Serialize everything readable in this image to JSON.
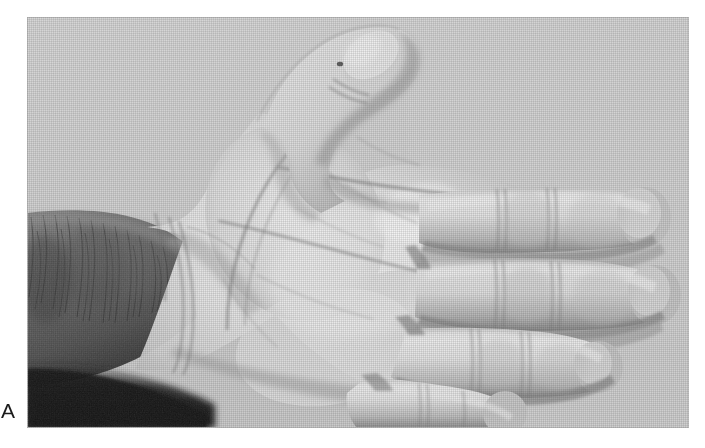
{
  "figure": {
    "panel_letter": "A",
    "media_type": "photograph",
    "color_mode": "grayscale"
  },
  "photo": {
    "background_color": "#d2d2d2",
    "skin_light": "#ededed",
    "skin_mid": "#d8d8d8",
    "skin_shadow": "#a9a9a9",
    "crease_color": "#7c7c7c",
    "deep_shadow": "#3a3a3a",
    "forearm_dark": "#5a5a5a",
    "hair_color": "#2c2c2c",
    "regions": [
      "thumb",
      "index-finger",
      "middle-finger",
      "ring-finger",
      "little-finger",
      "thenar-eminence",
      "hypothenar-eminence",
      "palm",
      "wrist",
      "forearm"
    ],
    "creases": [
      "distal-palmar-crease",
      "proximal-palmar-crease",
      "thenar-crease",
      "wrist-crease"
    ]
  },
  "page": {
    "background_color": "#ffffff",
    "width": 705,
    "height": 448
  }
}
